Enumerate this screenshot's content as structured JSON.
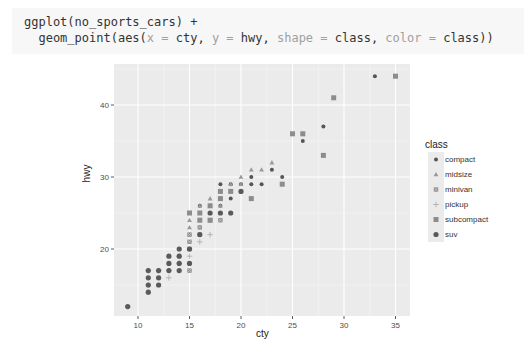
{
  "code": {
    "line1": "ggplot(no_sports_cars) +",
    "line2_prefix": "  geom_point(aes(",
    "x_arg": "x",
    "eq": " = ",
    "x_val": "cty",
    "sep": ", ",
    "y_arg": "y",
    "y_val": "hwy",
    "shape_arg": "shape",
    "shape_val": "class",
    "color_arg": "color",
    "color_val": "class",
    "suffix": "))"
  },
  "chart_data": {
    "type": "scatter",
    "title": "",
    "xlabel": "cty",
    "ylabel": "hwy",
    "xlim": [
      8.4,
      35.6
    ],
    "ylim": [
      10.3,
      45.7
    ],
    "x_ticks": [
      10,
      15,
      20,
      25,
      30,
      35
    ],
    "y_ticks": [
      20,
      30,
      40
    ],
    "grid": true,
    "legend": {
      "title": "class",
      "position": "right",
      "entries": [
        "compact",
        "midsize",
        "minivan",
        "pickup",
        "subcompact",
        "suv"
      ]
    },
    "series": [
      {
        "name": "compact",
        "shape": "circle",
        "points": [
          [
            33,
            44
          ],
          [
            28,
            37
          ],
          [
            26,
            35
          ],
          [
            24,
            30
          ],
          [
            23,
            31
          ],
          [
            22,
            29
          ],
          [
            21,
            29
          ],
          [
            21,
            30
          ],
          [
            20,
            28
          ],
          [
            20,
            29
          ],
          [
            19,
            27
          ],
          [
            19,
            29
          ],
          [
            18,
            27
          ],
          [
            18,
            26
          ],
          [
            18,
            29
          ],
          [
            17,
            26
          ],
          [
            16,
            26
          ],
          [
            16,
            25
          ]
        ]
      },
      {
        "name": "midsize",
        "shape": "triangle",
        "points": [
          [
            23,
            32
          ],
          [
            22,
            31
          ],
          [
            21,
            31
          ],
          [
            20,
            29
          ],
          [
            20,
            30
          ],
          [
            19,
            28
          ],
          [
            19,
            29
          ],
          [
            18,
            28
          ],
          [
            18,
            26
          ],
          [
            17,
            27
          ],
          [
            17,
            26
          ],
          [
            16,
            26
          ],
          [
            15,
            25
          ],
          [
            15,
            24
          ],
          [
            15,
            23
          ],
          [
            15,
            22
          ]
        ]
      },
      {
        "name": "minivan",
        "shape": "square-cross",
        "points": [
          [
            18,
            24
          ],
          [
            17,
            24
          ],
          [
            16,
            23
          ],
          [
            16,
            22
          ],
          [
            15,
            22
          ],
          [
            15,
            21
          ],
          [
            15,
            20
          ],
          [
            15,
            17
          ]
        ]
      },
      {
        "name": "pickup",
        "shape": "plus",
        "points": [
          [
            17,
            22
          ],
          [
            16,
            21
          ],
          [
            15,
            20
          ],
          [
            15,
            19
          ],
          [
            14,
            19
          ],
          [
            13,
            17
          ],
          [
            12,
            17
          ],
          [
            14,
            18
          ],
          [
            13,
            16
          ],
          [
            11,
            15
          ],
          [
            11,
            17
          ],
          [
            9,
            12
          ]
        ]
      },
      {
        "name": "subcompact",
        "shape": "square",
        "points": [
          [
            35,
            44
          ],
          [
            29,
            41
          ],
          [
            28,
            33
          ],
          [
            26,
            36
          ],
          [
            25,
            36
          ],
          [
            24,
            29
          ],
          [
            21,
            27
          ],
          [
            19,
            28
          ],
          [
            18,
            28
          ],
          [
            18,
            27
          ],
          [
            17,
            26
          ],
          [
            16,
            25
          ],
          [
            15,
            25
          ],
          [
            16,
            24
          ],
          [
            17,
            24
          ]
        ]
      },
      {
        "name": "suv",
        "shape": "circle-filled-large",
        "points": [
          [
            20,
            28
          ],
          [
            19,
            25
          ],
          [
            18,
            25
          ],
          [
            17,
            25
          ],
          [
            16,
            22
          ],
          [
            15,
            20
          ],
          [
            14,
            20
          ],
          [
            14,
            19
          ],
          [
            14,
            18
          ],
          [
            13,
            19
          ],
          [
            13,
            18
          ],
          [
            13,
            17
          ],
          [
            12,
            17
          ],
          [
            12,
            16
          ],
          [
            11,
            17
          ],
          [
            11,
            16
          ],
          [
            11,
            15
          ],
          [
            11,
            14
          ],
          [
            9,
            12
          ],
          [
            15,
            18
          ],
          [
            14,
            17
          ],
          [
            12,
            15
          ]
        ]
      }
    ]
  }
}
